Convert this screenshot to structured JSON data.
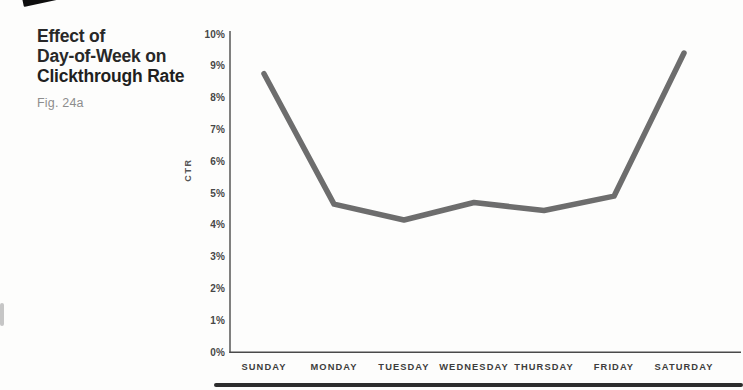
{
  "figure": {
    "title_lines": [
      "Effect of",
      "Day-of-Week on",
      "Clickthrough Rate"
    ],
    "fig_label": "Fig. 24a"
  },
  "chart_data": {
    "type": "line",
    "title": "Effect of Day-of-Week on Clickthrough Rate",
    "categories": [
      "SUNDAY",
      "MONDAY",
      "TUESDAY",
      "WEDNESDAY",
      "THURSDAY",
      "FRIDAY",
      "SATURDAY"
    ],
    "values": [
      8.75,
      4.65,
      4.15,
      4.7,
      4.45,
      4.9,
      9.4
    ],
    "xlabel": "",
    "ylabel": "CTR",
    "ylim": [
      0,
      10
    ],
    "y_ticks": [
      "0%",
      "1%",
      "2%",
      "3%",
      "4%",
      "5%",
      "6%",
      "7%",
      "8%",
      "9%",
      "10%"
    ],
    "grid": false,
    "legend": "none",
    "line_color": "#6d6d6d",
    "line_width": 5.5,
    "axis_color": "#4a4a4a"
  }
}
